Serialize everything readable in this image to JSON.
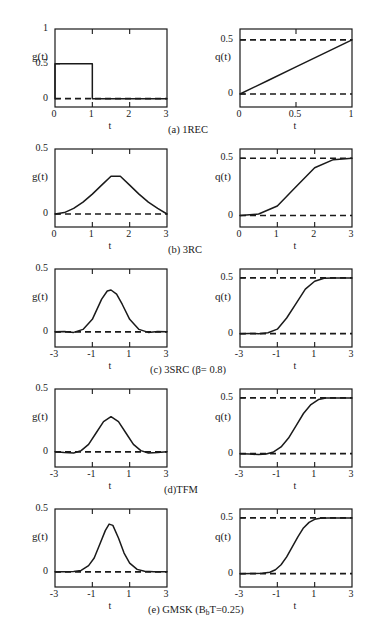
{
  "figure": {
    "rows": [
      {
        "id": "1rec",
        "caption": "(a) 1REC",
        "caption_x": 168,
        "caption_y": 104,
        "left": {
          "ylabel": "g(t)",
          "xlabel": "t",
          "yticks": [
            "1",
            "0.5",
            "0"
          ],
          "ytick_values": [
            1,
            0.5,
            0
          ],
          "xticks": [
            "0",
            "1",
            "2",
            "3"
          ],
          "xtick_values": [
            0,
            1,
            2,
            3
          ],
          "xlim": [
            0,
            3
          ],
          "ylim": [
            -0.12,
            1.0
          ],
          "dashed_level": 0
        },
        "right": {
          "ylabel": "q(t)",
          "xlabel": "t",
          "yticks": [
            "0.5",
            "0"
          ],
          "ytick_values": [
            0.5,
            0
          ],
          "xticks": [
            "0",
            "0.5",
            "1"
          ],
          "xtick_values": [
            0,
            0.5,
            1
          ],
          "xlim": [
            0,
            1
          ],
          "ylim": [
            -0.12,
            0.6
          ],
          "dashed_level": [
            0,
            0.5
          ]
        }
      },
      {
        "id": "3rc",
        "caption": "(b) 3RC",
        "caption_x": 168,
        "caption_y": 104,
        "left": {
          "ylabel": "g(t)",
          "xlabel": "t",
          "yticks": [
            "0.5",
            "0"
          ],
          "ytick_values": [
            0.5,
            0
          ],
          "xticks": [
            "0",
            "1",
            "2",
            "3"
          ],
          "xtick_values": [
            0,
            1,
            2,
            3
          ],
          "xlim": [
            0,
            3
          ],
          "ylim": [
            -0.1,
            0.5
          ],
          "dashed_level": 0
        },
        "right": {
          "ylabel": "q(t)",
          "xlabel": "t",
          "yticks": [
            "0.5",
            "0"
          ],
          "ytick_values": [
            0.5,
            0
          ],
          "xticks": [
            "0",
            "1",
            "2",
            "3"
          ],
          "xtick_values": [
            0,
            1,
            2,
            3
          ],
          "xlim": [
            0,
            3
          ],
          "ylim": [
            -0.1,
            0.58
          ],
          "dashed_level": [
            0,
            0.5
          ]
        }
      },
      {
        "id": "3src",
        "caption": "(c) 3SRC (β= 0.8)",
        "caption_x": 150,
        "caption_y": 104,
        "left": {
          "ylabel": "g(t)",
          "xlabel": "t",
          "yticks": [
            "0.5",
            "0"
          ],
          "ytick_values": [
            0.5,
            0
          ],
          "xticks": [
            "-3",
            "-1",
            "1",
            "3"
          ],
          "xtick_values": [
            -3,
            -1,
            1,
            3
          ],
          "xlim": [
            -3,
            3
          ],
          "ylim": [
            -0.12,
            0.5
          ],
          "dashed_level": 0
        },
        "right": {
          "ylabel": "q(t)",
          "xlabel": "t",
          "yticks": [
            "0.5",
            "0"
          ],
          "ytick_values": [
            0.5,
            0
          ],
          "xticks": [
            "-3",
            "-1",
            "1",
            "3"
          ],
          "xtick_values": [
            -3,
            -1,
            1,
            3
          ],
          "xlim": [
            -3,
            3
          ],
          "ylim": [
            -0.12,
            0.58
          ],
          "dashed_level": [
            0,
            0.5
          ]
        }
      },
      {
        "id": "tfm",
        "caption": "(d)TFM",
        "caption_x": 164,
        "caption_y": 104,
        "left": {
          "ylabel": "g(t)",
          "xlabel": "t",
          "yticks": [
            "0.5",
            "0"
          ],
          "ytick_values": [
            0.5,
            0
          ],
          "xticks": [
            "-3",
            "-1",
            "1",
            "3"
          ],
          "xtick_values": [
            -3,
            -1,
            1,
            3
          ],
          "xlim": [
            -3,
            3
          ],
          "ylim": [
            -0.12,
            0.5
          ],
          "dashed_level": 0
        },
        "right": {
          "ylabel": "q(t)",
          "xlabel": "t",
          "yticks": [
            "0.5",
            "0"
          ],
          "ytick_values": [
            0.5,
            0
          ],
          "xticks": [
            "-3",
            "-1",
            "1",
            "3"
          ],
          "xtick_values": [
            -3,
            -1,
            1,
            3
          ],
          "xlim": [
            -3,
            3
          ],
          "ylim": [
            -0.12,
            0.58
          ],
          "dashed_level": [
            0,
            0.5
          ]
        }
      },
      {
        "id": "gmsk",
        "caption": "(e) GMSK  (B_bT=0.25)",
        "caption_html": "(e) GMSK  (B<sub>b</sub>T=0.25)",
        "caption_x": 148,
        "caption_y": 104,
        "left": {
          "ylabel": "g(t)",
          "xlabel": "t",
          "yticks": [
            "0.5",
            "0"
          ],
          "ytick_values": [
            0.5,
            0
          ],
          "xticks": [
            "-3",
            "-1",
            "1",
            "3"
          ],
          "xtick_values": [
            -3,
            -1,
            1,
            3
          ],
          "xlim": [
            -3,
            3
          ],
          "ylim": [
            -0.12,
            0.5
          ],
          "dashed_level": 0
        },
        "right": {
          "ylabel": "q(t)",
          "xlabel": "t",
          "yticks": [
            "0.5",
            "0"
          ],
          "ytick_values": [
            0.5,
            0
          ],
          "xticks": [
            "-3",
            "-1",
            "1",
            "3"
          ],
          "xtick_values": [
            -3,
            -1,
            1,
            3
          ],
          "xlim": [
            -3,
            3
          ],
          "ylim": [
            -0.12,
            0.58
          ],
          "dashed_level": [
            0,
            0.5
          ]
        }
      }
    ]
  },
  "chart_data": [
    {
      "type": "line",
      "id": "1rec-g",
      "title": "(a) 1REC g(t)",
      "xlabel": "t",
      "ylabel": "g(t)",
      "xlim": [
        0,
        3
      ],
      "ylim": [
        -0.12,
        1.0
      ],
      "xticks": [
        0,
        1,
        2,
        3
      ],
      "yticks": [
        0,
        0.5,
        1
      ],
      "grid": false,
      "series": [
        {
          "name": "g(t)",
          "style": "solid",
          "x": [
            0,
            0,
            1,
            1,
            3
          ],
          "y": [
            0,
            0.5,
            0.5,
            0,
            0
          ]
        },
        {
          "name": "zero-reference",
          "style": "dashed",
          "x": [
            0,
            3
          ],
          "y": [
            0,
            0
          ]
        }
      ]
    },
    {
      "type": "line",
      "id": "1rec-q",
      "title": "(a) 1REC q(t)",
      "xlabel": "t",
      "ylabel": "q(t)",
      "xlim": [
        0,
        1
      ],
      "ylim": [
        -0.12,
        0.6
      ],
      "xticks": [
        0,
        0.5,
        1
      ],
      "yticks": [
        0,
        0.5
      ],
      "grid": false,
      "series": [
        {
          "name": "q(t)",
          "style": "solid",
          "x": [
            0,
            0.25,
            0.5,
            0.75,
            1
          ],
          "y": [
            0,
            0.125,
            0.25,
            0.375,
            0.5
          ]
        },
        {
          "name": "zero-reference",
          "style": "dashed",
          "x": [
            0,
            1
          ],
          "y": [
            0,
            0
          ]
        },
        {
          "name": "half-reference",
          "style": "dashed",
          "x": [
            0,
            1
          ],
          "y": [
            0.5,
            0.5
          ]
        }
      ]
    },
    {
      "type": "line",
      "id": "3rc-g",
      "title": "(b) 3RC g(t)",
      "xlabel": "t",
      "ylabel": "g(t)",
      "xlim": [
        0,
        3
      ],
      "ylim": [
        -0.1,
        0.5
      ],
      "xticks": [
        0,
        1,
        2,
        3
      ],
      "yticks": [
        0,
        0.5
      ],
      "grid": false,
      "series": [
        {
          "name": "g(t)",
          "style": "solid",
          "x": [
            0,
            0.25,
            0.5,
            0.75,
            1,
            1.25,
            1.5,
            1.75,
            2,
            2.25,
            2.5,
            2.75,
            3
          ],
          "y": [
            0,
            0.011,
            0.043,
            0.091,
            0.153,
            0.222,
            0.29,
            0.29,
            0.222,
            0.153,
            0.091,
            0.043,
            0
          ]
        },
        {
          "name": "zero-reference",
          "style": "dashed",
          "x": [
            0,
            3
          ],
          "y": [
            0,
            0
          ]
        }
      ],
      "peak": {
        "x": 1.5,
        "y": 0.333
      }
    },
    {
      "type": "line",
      "id": "3rc-q",
      "title": "(b) 3RC q(t)",
      "xlabel": "t",
      "ylabel": "q(t)",
      "xlim": [
        0,
        3
      ],
      "ylim": [
        -0.1,
        0.58
      ],
      "xticks": [
        0,
        1,
        2,
        3
      ],
      "yticks": [
        0,
        0.5
      ],
      "grid": false,
      "series": [
        {
          "name": "q(t)",
          "style": "solid",
          "x": [
            0,
            0.5,
            1,
            1.5,
            2,
            2.5,
            3
          ],
          "y": [
            0,
            0.013,
            0.083,
            0.25,
            0.417,
            0.487,
            0.5
          ]
        },
        {
          "name": "zero-reference",
          "style": "dashed",
          "x": [
            0,
            3
          ],
          "y": [
            0,
            0
          ]
        },
        {
          "name": "half-reference",
          "style": "dashed",
          "x": [
            0,
            3
          ],
          "y": [
            0.5,
            0.5
          ]
        }
      ]
    },
    {
      "type": "line",
      "id": "3src-g",
      "title": "(c) 3SRC (β= 0.8) g(t)",
      "xlabel": "t",
      "ylabel": "g(t)",
      "xlim": [
        -3,
        3
      ],
      "ylim": [
        -0.12,
        0.5
      ],
      "xticks": [
        -3,
        -1,
        1,
        3
      ],
      "yticks": [
        0,
        0.5
      ],
      "grid": false,
      "series": [
        {
          "name": "g(t)",
          "style": "solid",
          "x": [
            -3,
            -2.5,
            -2,
            -1.5,
            -1,
            -0.5,
            -0.2,
            0,
            0.3,
            0.6,
            1,
            1.5,
            2,
            2.5,
            3
          ],
          "y": [
            0.002,
            0.004,
            -0.004,
            0.02,
            0.1,
            0.26,
            0.325,
            0.333,
            0.3,
            0.22,
            0.1,
            0.02,
            -0.004,
            0.004,
            0.002
          ]
        },
        {
          "name": "zero-reference",
          "style": "dashed",
          "x": [
            -3,
            3
          ],
          "y": [
            0,
            0
          ]
        }
      ],
      "peak": {
        "x": 0,
        "y": 0.333
      }
    },
    {
      "type": "line",
      "id": "3src-q",
      "title": "(c) 3SRC (β= 0.8) q(t)",
      "xlabel": "t",
      "ylabel": "q(t)",
      "xlim": [
        -3,
        3
      ],
      "ylim": [
        -0.12,
        0.58
      ],
      "xticks": [
        -3,
        -1,
        1,
        3
      ],
      "yticks": [
        0,
        0.5
      ],
      "grid": false,
      "series": [
        {
          "name": "q(t)",
          "style": "solid",
          "x": [
            -3,
            -2.5,
            -2,
            -1.5,
            -1,
            -0.5,
            0,
            0.5,
            1,
            1.5,
            2,
            2.5,
            3
          ],
          "y": [
            0,
            0.002,
            0.0,
            0.008,
            0.04,
            0.14,
            0.27,
            0.4,
            0.47,
            0.497,
            0.5,
            0.5,
            0.5
          ]
        },
        {
          "name": "zero-reference",
          "style": "dashed",
          "x": [
            -3,
            3
          ],
          "y": [
            0,
            0
          ]
        },
        {
          "name": "half-reference",
          "style": "dashed",
          "x": [
            -3,
            3
          ],
          "y": [
            0.5,
            0.5
          ]
        }
      ]
    },
    {
      "type": "line",
      "id": "tfm-g",
      "title": "(d)TFM g(t)",
      "xlabel": "t",
      "ylabel": "g(t)",
      "xlim": [
        -3,
        3
      ],
      "ylim": [
        -0.12,
        0.5
      ],
      "xticks": [
        -3,
        -1,
        1,
        3
      ],
      "yticks": [
        0,
        0.5
      ],
      "grid": false,
      "series": [
        {
          "name": "g(t)",
          "style": "solid",
          "x": [
            -3,
            -2.5,
            -2,
            -1.6,
            -1.2,
            -0.8,
            -0.4,
            0,
            0.4,
            0.8,
            1.2,
            1.6,
            2,
            2.5,
            3
          ],
          "y": [
            0.002,
            -0.004,
            -0.008,
            0.01,
            0.06,
            0.15,
            0.24,
            0.28,
            0.24,
            0.15,
            0.06,
            0.01,
            -0.008,
            -0.004,
            0.002
          ]
        },
        {
          "name": "zero-reference",
          "style": "dashed",
          "x": [
            -3,
            3
          ],
          "y": [
            0,
            0
          ]
        }
      ],
      "peak": {
        "x": 0,
        "y": 0.285
      }
    },
    {
      "type": "line",
      "id": "tfm-q",
      "title": "(d)TFM q(t)",
      "xlabel": "t",
      "ylabel": "q(t)",
      "xlim": [
        -3,
        3
      ],
      "ylim": [
        -0.12,
        0.58
      ],
      "xticks": [
        -3,
        -1,
        1,
        3
      ],
      "yticks": [
        0,
        0.5
      ],
      "grid": false,
      "series": [
        {
          "name": "q(t)",
          "style": "solid",
          "x": [
            -3,
            -2.5,
            -2,
            -1.6,
            -1.2,
            -0.8,
            -0.4,
            0,
            0.4,
            0.8,
            1.2,
            1.6,
            2,
            2.5,
            3
          ],
          "y": [
            0,
            -0.004,
            -0.008,
            -0.004,
            0.015,
            0.06,
            0.14,
            0.25,
            0.36,
            0.44,
            0.485,
            0.5,
            0.5,
            0.5,
            0.5
          ]
        },
        {
          "name": "zero-reference",
          "style": "dashed",
          "x": [
            -3,
            3
          ],
          "y": [
            0,
            0
          ]
        },
        {
          "name": "half-reference",
          "style": "dashed",
          "x": [
            -3,
            3
          ],
          "y": [
            0.5,
            0.5
          ]
        }
      ]
    },
    {
      "type": "line",
      "id": "gmsk-g",
      "title": "(e) GMSK (BbT=0.25) g(t)",
      "xlabel": "t",
      "ylabel": "g(t)",
      "xlim": [
        -3,
        3
      ],
      "ylim": [
        -0.12,
        0.5
      ],
      "xticks": [
        -3,
        -1,
        1,
        3
      ],
      "yticks": [
        0,
        0.5
      ],
      "grid": false,
      "series": [
        {
          "name": "g(t)",
          "style": "solid",
          "x": [
            -3,
            -2.5,
            -2,
            -1.6,
            -1.2,
            -0.9,
            -0.6,
            -0.3,
            -0.1,
            0.1,
            0.4,
            0.7,
            1,
            1.4,
            1.8,
            2.3,
            3
          ],
          "y": [
            0.002,
            0.002,
            0.004,
            0.012,
            0.05,
            0.11,
            0.22,
            0.33,
            0.38,
            0.37,
            0.27,
            0.15,
            0.07,
            0.02,
            0.005,
            0.002,
            0.002
          ]
        },
        {
          "name": "zero-reference",
          "style": "dashed",
          "x": [
            -3,
            3
          ],
          "y": [
            0,
            0
          ]
        }
      ],
      "peak": {
        "x": -0.05,
        "y": 0.39
      }
    },
    {
      "type": "line",
      "id": "gmsk-q",
      "title": "(e) GMSK (BbT=0.25) q(t)",
      "xlabel": "t",
      "ylabel": "q(t)",
      "xlim": [
        -3,
        3
      ],
      "ylim": [
        -0.12,
        0.58
      ],
      "xticks": [
        -3,
        -1,
        1,
        3
      ],
      "yticks": [
        0,
        0.5
      ],
      "grid": false,
      "series": [
        {
          "name": "q(t)",
          "style": "solid",
          "x": [
            -3,
            -2.4,
            -1.8,
            -1.4,
            -1.1,
            -0.8,
            -0.5,
            -0.2,
            0.1,
            0.4,
            0.7,
            1,
            1.3,
            1.7,
            2.2,
            3
          ],
          "y": [
            0,
            0.001,
            0.003,
            0.012,
            0.035,
            0.08,
            0.15,
            0.24,
            0.33,
            0.41,
            0.46,
            0.487,
            0.497,
            0.5,
            0.5,
            0.5
          ]
        },
        {
          "name": "zero-reference",
          "style": "dashed",
          "x": [
            -3,
            3
          ],
          "y": [
            0,
            0
          ]
        },
        {
          "name": "half-reference",
          "style": "dashed",
          "x": [
            -3,
            3
          ],
          "y": [
            0.5,
            0.5
          ]
        }
      ]
    }
  ]
}
